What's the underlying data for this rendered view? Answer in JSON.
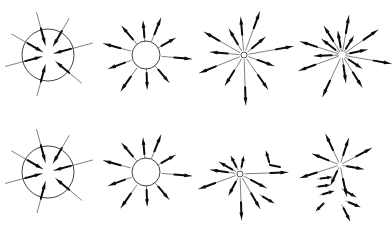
{
  "figure": {
    "title": "Radial arrow evolution panels",
    "background_color": "#ffffff",
    "line_color": "#1a1a1a",
    "arrow_color": "#0d0d0d",
    "width": 392,
    "height": 234,
    "rows": 2,
    "columns": 4
  },
  "panels": [
    {
      "id": "panel-r1c1",
      "row": 1,
      "column": 1,
      "label": "large circle with inward arrows",
      "center": [
        48,
        55
      ],
      "circle_radius": 26,
      "has_circle": true,
      "hub_dot": false,
      "arrow_count": 7,
      "arrows": [
        {
          "angle": 255,
          "inner": 6,
          "outer": 44,
          "head_at": "inner"
        },
        {
          "angle": 300,
          "inner": 6,
          "outer": 42,
          "head_at": "inner"
        },
        {
          "angle": 345,
          "inner": 10,
          "outer": 44,
          "head_at": "inner"
        },
        {
          "angle": 30,
          "inner": 10,
          "outer": 42,
          "head_at": "inner"
        },
        {
          "angle": 75,
          "inner": 6,
          "outer": 46,
          "head_at": "inner"
        },
        {
          "angle": 130,
          "inner": 10,
          "outer": 44,
          "head_at": "inner"
        },
        {
          "angle": 195,
          "inner": 10,
          "outer": 42,
          "head_at": "inner"
        }
      ]
    },
    {
      "id": "panel-r1c2",
      "row": 1,
      "column": 2,
      "label": "small circle with radiating arrows",
      "center": [
        48,
        55
      ],
      "circle_radius": 14,
      "has_circle": true,
      "hub_dot": false,
      "arrow_count": 10,
      "arrows": [
        {
          "angle": 250,
          "inner": 16,
          "outer": 40,
          "head_at": "outer"
        },
        {
          "angle": 285,
          "inner": 16,
          "outer": 44,
          "head_at": "outer"
        },
        {
          "angle": 320,
          "inner": 15,
          "outer": 38,
          "head_at": "outer"
        },
        {
          "angle": 355,
          "inner": 14,
          "outer": 34,
          "head_at": "outer"
        },
        {
          "angle": 22,
          "inner": 15,
          "outer": 40,
          "head_at": "outer"
        },
        {
          "angle": 60,
          "inner": 14,
          "outer": 34,
          "head_at": "outer"
        },
        {
          "angle": 95,
          "inner": 16,
          "outer": 46,
          "head_at": "outer"
        },
        {
          "angle": 140,
          "inner": 15,
          "outer": 36,
          "head_at": "outer"
        },
        {
          "angle": 178,
          "inner": 14,
          "outer": 34,
          "head_at": "outer"
        },
        {
          "angle": 215,
          "inner": 16,
          "outer": 44,
          "head_at": "outer"
        }
      ]
    },
    {
      "id": "panel-r1c3",
      "row": 1,
      "column": 3,
      "label": "point burst with long radiating arrows",
      "center": [
        48,
        55
      ],
      "circle_radius": 3,
      "has_circle": false,
      "hub_dot": true,
      "arrow_count": 12,
      "arrows": [
        {
          "angle": 248,
          "inner": 5,
          "outer": 48,
          "head_at": "outer"
        },
        {
          "angle": 275,
          "inner": 5,
          "outer": 34,
          "head_at": "outer"
        },
        {
          "angle": 300,
          "inner": 5,
          "outer": 46,
          "head_at": "outer"
        },
        {
          "angle": 330,
          "inner": 5,
          "outer": 30,
          "head_at": "outer"
        },
        {
          "angle": 355,
          "inner": 5,
          "outer": 38,
          "head_at": "outer"
        },
        {
          "angle": 20,
          "inner": 5,
          "outer": 46,
          "head_at": "outer"
        },
        {
          "angle": 50,
          "inner": 5,
          "outer": 28,
          "head_at": "outer"
        },
        {
          "angle": 80,
          "inner": 5,
          "outer": 50,
          "head_at": "outer"
        },
        {
          "angle": 110,
          "inner": 5,
          "outer": 32,
          "head_at": "outer"
        },
        {
          "angle": 145,
          "inner": 5,
          "outer": 42,
          "head_at": "outer"
        },
        {
          "angle": 178,
          "inner": 5,
          "outer": 50,
          "head_at": "outer"
        },
        {
          "angle": 212,
          "inner": 5,
          "outer": 36,
          "head_at": "outer"
        }
      ]
    },
    {
      "id": "panel-r1c4",
      "row": 1,
      "column": 4,
      "label": "point burst with dense radiating arrows",
      "center": [
        48,
        55
      ],
      "circle_radius": 2,
      "has_circle": false,
      "hub_dot": false,
      "arrow_count": 15,
      "arrows": [
        {
          "angle": 250,
          "inner": 4,
          "outer": 46,
          "head_at": "outer"
        },
        {
          "angle": 268,
          "inner": 4,
          "outer": 28,
          "head_at": "outer"
        },
        {
          "angle": 288,
          "inner": 4,
          "outer": 44,
          "head_at": "outer"
        },
        {
          "angle": 308,
          "inner": 4,
          "outer": 26,
          "head_at": "outer"
        },
        {
          "angle": 328,
          "inner": 4,
          "outer": 34,
          "head_at": "outer"
        },
        {
          "angle": 350,
          "inner": 4,
          "outer": 24,
          "head_at": "outer"
        },
        {
          "angle": 10,
          "inner": 4,
          "outer": 40,
          "head_at": "outer"
        },
        {
          "angle": 32,
          "inner": 4,
          "outer": 22,
          "head_at": "outer"
        },
        {
          "angle": 55,
          "inner": 4,
          "outer": 44,
          "head_at": "outer"
        },
        {
          "angle": 78,
          "inner": 4,
          "outer": 26,
          "head_at": "outer"
        },
        {
          "angle": 100,
          "inner": 4,
          "outer": 50,
          "head_at": "outer"
        },
        {
          "angle": 124,
          "inner": 4,
          "outer": 24,
          "head_at": "outer"
        },
        {
          "angle": 148,
          "inner": 4,
          "outer": 38,
          "head_at": "outer"
        },
        {
          "angle": 172,
          "inner": 4,
          "outer": 28,
          "head_at": "outer"
        },
        {
          "angle": 205,
          "inner": 4,
          "outer": 46,
          "head_at": "outer"
        }
      ]
    },
    {
      "id": "panel-r2c1",
      "row": 2,
      "column": 1,
      "label": "large circle with inward arrows",
      "center": [
        48,
        55
      ],
      "circle_radius": 26,
      "has_circle": true,
      "hub_dot": false,
      "arrow_count": 7,
      "arrows": [
        {
          "angle": 255,
          "inner": 6,
          "outer": 44,
          "head_at": "inner"
        },
        {
          "angle": 300,
          "inner": 6,
          "outer": 42,
          "head_at": "inner"
        },
        {
          "angle": 345,
          "inner": 10,
          "outer": 44,
          "head_at": "inner"
        },
        {
          "angle": 30,
          "inner": 10,
          "outer": 42,
          "head_at": "inner"
        },
        {
          "angle": 75,
          "inner": 6,
          "outer": 46,
          "head_at": "inner"
        },
        {
          "angle": 130,
          "inner": 10,
          "outer": 44,
          "head_at": "inner"
        },
        {
          "angle": 195,
          "inner": 10,
          "outer": 42,
          "head_at": "inner"
        }
      ]
    },
    {
      "id": "panel-r2c2",
      "row": 2,
      "column": 2,
      "label": "small circle with radiating arrows",
      "center": [
        48,
        55
      ],
      "circle_radius": 14,
      "has_circle": true,
      "hub_dot": false,
      "arrow_count": 10,
      "arrows": [
        {
          "angle": 250,
          "inner": 16,
          "outer": 40,
          "head_at": "outer"
        },
        {
          "angle": 285,
          "inner": 16,
          "outer": 44,
          "head_at": "outer"
        },
        {
          "angle": 320,
          "inner": 15,
          "outer": 38,
          "head_at": "outer"
        },
        {
          "angle": 355,
          "inner": 14,
          "outer": 34,
          "head_at": "outer"
        },
        {
          "angle": 22,
          "inner": 15,
          "outer": 40,
          "head_at": "outer"
        },
        {
          "angle": 60,
          "inner": 14,
          "outer": 34,
          "head_at": "outer"
        },
        {
          "angle": 95,
          "inner": 16,
          "outer": 46,
          "head_at": "outer"
        },
        {
          "angle": 140,
          "inner": 15,
          "outer": 36,
          "head_at": "outer"
        },
        {
          "angle": 178,
          "inner": 14,
          "outer": 34,
          "head_at": "outer"
        },
        {
          "angle": 215,
          "inner": 16,
          "outer": 44,
          "head_at": "outer"
        }
      ]
    },
    {
      "id": "panel-r2c3",
      "row": 2,
      "column": 3,
      "label": "point burst with detached fragments",
      "center": [
        44,
        57
      ],
      "circle_radius": 3,
      "has_circle": false,
      "hub_dot": true,
      "arrow_count": 10,
      "arrows": [
        {
          "angle": 250,
          "inner": 5,
          "outer": 44,
          "head_at": "outer"
        },
        {
          "angle": 278,
          "inner": 5,
          "outer": 30,
          "head_at": "outer"
        },
        {
          "angle": 300,
          "inner": 5,
          "outer": 24,
          "head_at": "outer"
        },
        {
          "angle": 333,
          "inner": 5,
          "outer": 20,
          "head_at": "outer"
        },
        {
          "angle": 12,
          "inner": 5,
          "outer": 18,
          "head_at": "outer"
        },
        {
          "angle": 88,
          "inner": 5,
          "outer": 48,
          "head_at": "outer"
        },
        {
          "angle": 118,
          "inner": 5,
          "outer": 30,
          "head_at": "outer"
        },
        {
          "angle": 150,
          "inner": 5,
          "outer": 40,
          "head_at": "outer"
        },
        {
          "angle": 178,
          "inner": 5,
          "outer": 46,
          "head_at": "outer"
        },
        {
          "angle": 208,
          "inner": 5,
          "outer": 24,
          "head_at": "outer"
        }
      ],
      "fragments": [
        {
          "type": "hook",
          "points": [
            [
              74,
              48
            ],
            [
              70,
              34
            ]
          ],
          "tail": [
            [
              74,
              48
            ],
            [
              84,
              50
            ]
          ],
          "head_at": "end"
        },
        {
          "type": "arrow",
          "points": [
            [
              64,
              78
            ],
            [
              78,
              86
            ]
          ],
          "head_at": "end"
        }
      ]
    },
    {
      "id": "panel-r2c4",
      "row": 2,
      "column": 4,
      "label": "fully fragmented scattered arrows",
      "center": [
        46,
        48
      ],
      "circle_radius": 0,
      "has_circle": false,
      "hub_dot": false,
      "arrow_count": 14,
      "arrows": [
        {
          "angle": 252,
          "inner": 3,
          "outer": 42,
          "head_at": "outer"
        },
        {
          "angle": 292,
          "inner": 3,
          "outer": 30,
          "head_at": "outer"
        },
        {
          "angle": 335,
          "inner": 3,
          "outer": 34,
          "head_at": "outer"
        },
        {
          "angle": 18,
          "inner": 3,
          "outer": 28,
          "head_at": "outer"
        },
        {
          "angle": 62,
          "inner": 3,
          "outer": 36,
          "head_at": "outer"
        },
        {
          "angle": 100,
          "inner": 3,
          "outer": 24,
          "head_at": "outer"
        },
        {
          "angle": 168,
          "inner": 3,
          "outer": 32,
          "head_at": "outer"
        },
        {
          "angle": 205,
          "inner": 3,
          "outer": 22,
          "head_at": "outer"
        }
      ],
      "fragments": [
        {
          "type": "arrow",
          "points": [
            [
              24,
              62
            ],
            [
              38,
              60
            ]
          ],
          "head_at": "end"
        },
        {
          "type": "arrow",
          "points": [
            [
              22,
              70
            ],
            [
              36,
              68
            ]
          ],
          "head_at": "end"
        },
        {
          "type": "arrow",
          "points": [
            [
              26,
              78
            ],
            [
              40,
              74
            ]
          ],
          "head_at": "end"
        },
        {
          "type": "arrow",
          "points": [
            [
              30,
              86
            ],
            [
              22,
              94
            ]
          ],
          "head_at": "end"
        },
        {
          "type": "arrow",
          "points": [
            [
              48,
              72
            ],
            [
              62,
              80
            ]
          ],
          "head_at": "end"
        },
        {
          "type": "arrow",
          "points": [
            [
              52,
              84
            ],
            [
              66,
              90
            ]
          ],
          "head_at": "end"
        },
        {
          "type": "arrow",
          "points": [
            [
              48,
              88
            ],
            [
              56,
              104
            ]
          ],
          "head_at": "end"
        }
      ]
    }
  ]
}
